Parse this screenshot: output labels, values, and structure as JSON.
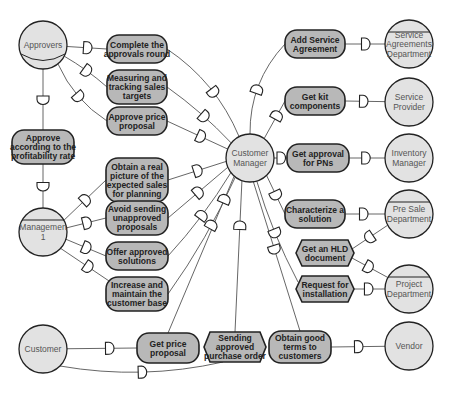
{
  "diagram": {
    "type": "i* strategic dependency model",
    "colors": {
      "actor_fill": "#e2e2e2",
      "goal_fill": "#b8b8b8",
      "stroke": "#222222",
      "link": "#555555",
      "background": "#ffffff"
    },
    "actors": [
      {
        "id": "approvers",
        "label": [
          "Approvers"
        ],
        "kind": "role"
      },
      {
        "id": "management",
        "label": [
          "Managemen",
          "1"
        ],
        "kind": "agent"
      },
      {
        "id": "customer",
        "label": [
          "Customer"
        ],
        "kind": "actor"
      },
      {
        "id": "customer_manager",
        "label": [
          "Customer",
          "Manager"
        ],
        "kind": "actor"
      },
      {
        "id": "service_agreements",
        "label": [
          "Service",
          "Agreements",
          "Department"
        ],
        "kind": "agent"
      },
      {
        "id": "service_provider",
        "label": [
          "Service",
          "Provider"
        ],
        "kind": "actor"
      },
      {
        "id": "inventory_manager",
        "label": [
          "Inventory",
          "Manager"
        ],
        "kind": "actor"
      },
      {
        "id": "pre_sale",
        "label": [
          "Pre Sale",
          "Department"
        ],
        "kind": "agent"
      },
      {
        "id": "project_dept",
        "label": [
          "Project",
          "Department"
        ],
        "kind": "agent"
      },
      {
        "id": "vendor",
        "label": [
          "Vendor"
        ],
        "kind": "actor"
      }
    ],
    "goals": [
      {
        "id": "complete_approvals",
        "label": [
          "Complete the",
          "approvals round"
        ],
        "shape": "goal"
      },
      {
        "id": "measuring_sales",
        "label": [
          "Measuring and",
          "tracking sales",
          "targets"
        ],
        "shape": "goal"
      },
      {
        "id": "approve_price",
        "label": [
          "Approve price",
          "proposal"
        ],
        "shape": "goal"
      },
      {
        "id": "approve_profit",
        "label": [
          "Approve",
          "according to the",
          "profitability rate"
        ],
        "shape": "goal"
      },
      {
        "id": "real_picture",
        "label": [
          "Obtain a real",
          "picture of the",
          "expected sales",
          "for planning"
        ],
        "shape": "goal"
      },
      {
        "id": "avoid_sending",
        "label": [
          "Avoid sending",
          "unapproved",
          "proposals"
        ],
        "shape": "goal"
      },
      {
        "id": "offer_approved",
        "label": [
          "Offer approved",
          "solutions"
        ],
        "shape": "goal"
      },
      {
        "id": "increase_base",
        "label": [
          "Increase and",
          "maintain the",
          "customer base"
        ],
        "shape": "goal"
      },
      {
        "id": "get_price",
        "label": [
          "Get price",
          "proposal"
        ],
        "shape": "goal"
      },
      {
        "id": "sending_po",
        "label": [
          "Sending",
          "approved",
          "purchase order"
        ],
        "shape": "task"
      },
      {
        "id": "obtain_terms",
        "label": [
          "Obtain good",
          "terms to",
          "customers"
        ],
        "shape": "goal"
      },
      {
        "id": "add_service",
        "label": [
          "Add Service",
          "Agreement"
        ],
        "shape": "goal"
      },
      {
        "id": "get_kit",
        "label": [
          "Get kit",
          "components"
        ],
        "shape": "goal"
      },
      {
        "id": "get_pns",
        "label": [
          "Get approval",
          "for PNs"
        ],
        "shape": "goal"
      },
      {
        "id": "characterize",
        "label": [
          "Characterize a",
          "solution"
        ],
        "shape": "goal"
      },
      {
        "id": "get_hld",
        "label": [
          "Get an HLD",
          "document"
        ],
        "shape": "task"
      },
      {
        "id": "request_install",
        "label": [
          "Request for",
          "installation"
        ],
        "shape": "task"
      }
    ],
    "dependencies": [
      {
        "from": "approvers",
        "via": "complete_approvals",
        "to": "customer_manager"
      },
      {
        "from": "approvers",
        "via": "measuring_sales",
        "to": "customer_manager"
      },
      {
        "from": "approvers",
        "via": "approve_price",
        "to": "customer_manager"
      },
      {
        "from": "approvers",
        "via": "approve_profit",
        "to": "management"
      },
      {
        "from": "management",
        "via": "real_picture",
        "to": "customer_manager"
      },
      {
        "from": "management",
        "via": "avoid_sending",
        "to": "customer_manager"
      },
      {
        "from": "management",
        "via": "offer_approved",
        "to": "customer_manager"
      },
      {
        "from": "management",
        "via": "increase_base",
        "to": "customer_manager"
      },
      {
        "from": "customer",
        "via": "get_price",
        "to": "customer_manager"
      },
      {
        "from": "customer",
        "via": "sending_po",
        "to": "customer_manager"
      },
      {
        "from": "customer_manager",
        "via": "obtain_terms",
        "to": "vendor"
      },
      {
        "from": "customer_manager",
        "via": "add_service",
        "to": "service_agreements"
      },
      {
        "from": "customer_manager",
        "via": "get_kit",
        "to": "service_provider"
      },
      {
        "from": "customer_manager",
        "via": "get_pns",
        "to": "inventory_manager"
      },
      {
        "from": "customer_manager",
        "via": "characterize",
        "to": "pre_sale"
      },
      {
        "from": "pre_sale",
        "via": "get_hld",
        "to": "project_dept"
      },
      {
        "from": "customer_manager",
        "via": "request_install",
        "to": "project_dept"
      }
    ]
  }
}
